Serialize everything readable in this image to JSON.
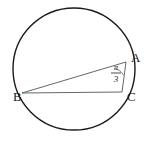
{
  "figure": {
    "type": "circle-geometry-diagram",
    "background_color": "#ffffff",
    "stroke_color": "#1a1a1a",
    "chord_color": "#555555",
    "circle": {
      "center_x": 74,
      "center_y": 69,
      "radius": 61
    },
    "points": [
      {
        "id": "A",
        "label": "A",
        "x": 126,
        "y": 62,
        "label_x": 131,
        "label_y": 62
      },
      {
        "id": "B",
        "label": "B",
        "x": 22,
        "y": 93,
        "label_x": 13,
        "label_y": 101
      },
      {
        "id": "C",
        "label": "C",
        "x": 122,
        "y": 92,
        "label_x": 127,
        "label_y": 101
      }
    ],
    "segments": [
      {
        "id": "BA",
        "from": "B",
        "to": "A",
        "x1": 22,
        "y1": 93,
        "x2": 126,
        "y2": 62
      },
      {
        "id": "BC",
        "from": "B",
        "to": "C",
        "x1": 22,
        "y1": 93,
        "x2": 122,
        "y2": 92
      },
      {
        "id": "AC",
        "from": "A",
        "to": "C",
        "x1": 126,
        "y1": 62,
        "x2": 122,
        "y2": 92
      }
    ],
    "angle": {
      "vertex": "A",
      "value_numerator": "π",
      "value_denominator": "3",
      "display": "π/3",
      "num_x": 116,
      "num_y": 70,
      "den_x": 116,
      "den_y": 81,
      "bar_x1": 111,
      "bar_x2": 122,
      "bar_y": 73,
      "arc_path": "M 114.0 68.2 A 13 13 0 0 1 123.4 74.8"
    }
  }
}
